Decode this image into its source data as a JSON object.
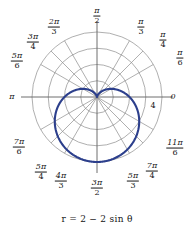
{
  "figure": {
    "name": "polar-cardioid-plot",
    "caption": "r = 2 − 2 sin θ",
    "background": "#ffffff",
    "curve_color": "#2c3f8c",
    "grid_color": "#8c8c8c",
    "axis_color": "#6e6e6e",
    "text_color": "#161616"
  },
  "chart_data": {
    "type": "line",
    "plot_kind": "polar",
    "title": "",
    "subtitle": "",
    "caption": "r = 2 − 2 sin θ",
    "equation": "r = 2 - 2*sin(theta)",
    "curve_name": "cardioid",
    "xlabel": "",
    "ylabel": "",
    "grid": true,
    "legend": null,
    "rlim": [
      0,
      4
    ],
    "r_ticks": [
      1,
      2,
      3,
      4
    ],
    "r_tick_labels": [
      "",
      "",
      "",
      "4"
    ],
    "r_labeled_tick": 4,
    "theta_direction": "counterclockwise",
    "theta_zero_location": "E",
    "angle_ticks_count": 12,
    "angle_ticks": [
      {
        "label": "0",
        "value_rad": 0,
        "display": "0",
        "type": "plain"
      },
      {
        "label": "pi/6",
        "value_rad": 0.5236,
        "num": "π",
        "den": "6",
        "type": "fraction"
      },
      {
        "label": "pi/4",
        "value_rad": 0.7854,
        "num": "π",
        "den": "4",
        "type": "fraction"
      },
      {
        "label": "pi/3",
        "value_rad": 1.0472,
        "num": "π",
        "den": "3",
        "type": "fraction"
      },
      {
        "label": "pi/2",
        "value_rad": 1.5708,
        "num": "π",
        "den": "2",
        "type": "fraction"
      },
      {
        "label": "2pi/3",
        "value_rad": 2.0944,
        "num": "2π",
        "den": "3",
        "type": "fraction"
      },
      {
        "label": "3pi/4",
        "value_rad": 2.3562,
        "num": "3π",
        "den": "4",
        "type": "fraction"
      },
      {
        "label": "5pi/6",
        "value_rad": 2.618,
        "num": "5π",
        "den": "6",
        "type": "fraction"
      },
      {
        "label": "pi",
        "value_rad": 3.1416,
        "display": "π",
        "type": "plain"
      },
      {
        "label": "7pi/6",
        "value_rad": 3.6652,
        "num": "7π",
        "den": "6",
        "type": "fraction"
      },
      {
        "label": "5pi/4",
        "value_rad": 3.927,
        "num": "5π",
        "den": "4",
        "type": "fraction"
      },
      {
        "label": "4pi/3",
        "value_rad": 4.1888,
        "num": "4π",
        "den": "3",
        "type": "fraction"
      },
      {
        "label": "3pi/2",
        "value_rad": 4.7124,
        "num": "3π",
        "den": "2",
        "type": "fraction"
      },
      {
        "label": "5pi/3",
        "value_rad": 5.236,
        "num": "5π",
        "den": "3",
        "type": "fraction"
      },
      {
        "label": "7pi/4",
        "value_rad": 5.4978,
        "num": "7π",
        "den": "4",
        "type": "fraction"
      },
      {
        "label": "11pi/6",
        "value_rad": 5.7596,
        "num": "11π",
        "den": "6",
        "type": "fraction"
      }
    ],
    "series": [
      {
        "name": "r = 2 - 2 sin(theta)",
        "color": "#2c3f8c",
        "points_theta_deg": [
          0,
          15,
          30,
          45,
          60,
          75,
          90,
          105,
          120,
          135,
          150,
          165,
          180,
          195,
          210,
          225,
          240,
          255,
          270,
          285,
          300,
          315,
          330,
          345,
          360
        ],
        "points_r": [
          2.0,
          1.482,
          1.0,
          0.586,
          0.268,
          0.069,
          0.0,
          0.069,
          0.268,
          0.586,
          1.0,
          1.482,
          2.0,
          2.518,
          3.0,
          3.414,
          3.732,
          3.931,
          4.0,
          3.931,
          3.732,
          3.414,
          3.0,
          2.518,
          2.0
        ]
      }
    ],
    "key_points": [
      {
        "theta_deg": 90,
        "r": 0,
        "note": "cusp at origin"
      },
      {
        "theta_deg": 270,
        "r": 4,
        "note": "maximum radius"
      },
      {
        "theta_deg": 0,
        "r": 2,
        "note": "intercept on 0 axis"
      },
      {
        "theta_deg": 180,
        "r": 2,
        "note": "intercept on pi axis"
      }
    ]
  },
  "labels": {
    "radial_tick_4": "4",
    "axis_zero": "0",
    "axis_pi": "π"
  }
}
